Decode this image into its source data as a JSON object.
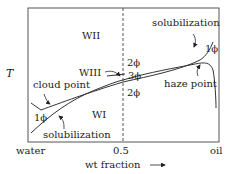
{
  "diagram": {
    "type": "phase-diagram",
    "y_axis_label": "T",
    "x_axis": {
      "label": "wt fraction",
      "left_end": "water",
      "midpoint": "0.5",
      "right_end": "oil"
    },
    "regions": {
      "wii": "WII",
      "wi": "WI",
      "wiii": "WIII"
    },
    "phase_labels": {
      "two_phase_top": "2ϕ",
      "three_phase": "3ϕ",
      "two_phase_bottom": "2ϕ",
      "one_phase_left": "1ϕ",
      "one_phase_right": "1ϕ"
    },
    "annotations": {
      "solubilization_top": "solubilization",
      "solubilization_bottom": "solubilization",
      "cloud_point": "cloud point",
      "haze_point": "haze point"
    },
    "colors": {
      "line": "#333333",
      "frame": "#555555",
      "background": "#ffffff"
    }
  }
}
